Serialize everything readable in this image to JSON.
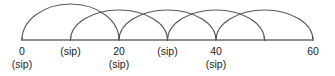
{
  "figure": {
    "kind": "number-line-jump-diagram",
    "line_color": "#6b6b6b",
    "arc_color": "#58585a",
    "text_color": "#1d1d1d",
    "background": "#ffffff"
  },
  "chart_data": {
    "type": "line",
    "title": "",
    "xlabel": "",
    "ylabel": "",
    "grid": false,
    "legend": null,
    "xlim": [
      0,
      60
    ],
    "axis": {
      "start_value": 0,
      "end_value": 60,
      "tick_values": [
        0,
        10,
        20,
        30,
        40,
        50,
        60
      ]
    },
    "tick_labels": [
      {
        "value": 0,
        "primary": "0",
        "secondary": "(sip)"
      },
      {
        "value": 10,
        "primary": "",
        "secondary": "(sip)"
      },
      {
        "value": 20,
        "primary": "20",
        "secondary": "(sip)"
      },
      {
        "value": 30,
        "primary": "",
        "secondary": "(sip)"
      },
      {
        "value": 40,
        "primary": "40",
        "secondary": "(sip)"
      },
      {
        "value": 60,
        "primary": "60",
        "secondary": ""
      }
    ],
    "arcs": [
      {
        "from": 0,
        "to": 20,
        "span": 20
      },
      {
        "from": 10,
        "to": 30,
        "span": 20
      },
      {
        "from": 20,
        "to": 40,
        "span": 20
      },
      {
        "from": 30,
        "to": 50,
        "span": 20
      },
      {
        "from": 40,
        "to": 60,
        "span": 20
      }
    ]
  }
}
